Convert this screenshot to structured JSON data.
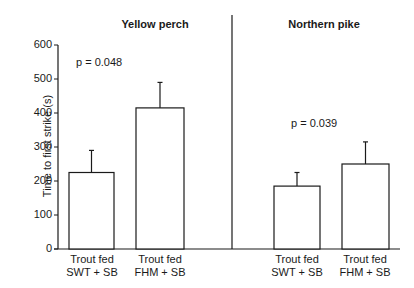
{
  "chart_data": {
    "type": "bar",
    "title": "",
    "ylabel": "Time to first strike (s)",
    "xlabel": "",
    "ylim": [
      0,
      600
    ],
    "yticks": [
      0,
      100,
      200,
      300,
      400,
      500,
      600
    ],
    "grid": false,
    "legend": null,
    "panels": [
      {
        "title": "Yellow perch",
        "annotation": "p = 0.048",
        "categories": [
          "Trout fed SWT + SB",
          "Trout fed FHM + SB"
        ],
        "category_lines": [
          [
            "Trout fed",
            "SWT + SB"
          ],
          [
            "Trout fed",
            "FHM + SB"
          ]
        ],
        "values": [
          225,
          415
        ],
        "error_upper": [
          290,
          490
        ]
      },
      {
        "title": "Northern pike",
        "annotation": "p = 0.039",
        "categories": [
          "Trout fed SWT + SB",
          "Trout fed FHM + SB"
        ],
        "category_lines": [
          [
            "Trout fed",
            "SWT + SB"
          ],
          [
            "Trout fed",
            "FHM + SB"
          ]
        ],
        "values": [
          185,
          250
        ],
        "error_upper": [
          225,
          315
        ]
      }
    ]
  },
  "colors": {
    "bar_fill": "#ffffff",
    "stroke": "#1a1a1a",
    "background": "#ffffff"
  }
}
